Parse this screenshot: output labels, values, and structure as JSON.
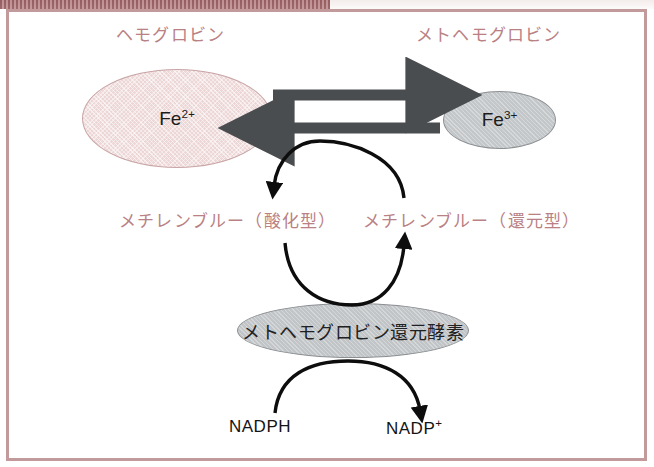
{
  "figure": {
    "top_labels": {
      "left": "ヘモグロビン",
      "right": "メトヘモグロビン"
    },
    "species": {
      "ferrous": "Fe",
      "ferrous_charge": "2+",
      "ferric": "Fe",
      "ferric_charge": "3+"
    },
    "middle_labels": {
      "left": "メチレンブルー（酸化型）",
      "right": "メチレンブルー（還元型）"
    },
    "enzyme": "メトヘモグロビン還元酵素",
    "cofactors": {
      "left": "NADPH",
      "right": "NADP",
      "right_charge": "+"
    },
    "colors": {
      "label_rose": "#b98184",
      "frame_border": "#c29a9c",
      "hemoglobin_fill": "#edd6d6",
      "methemoglobin_fill": "#c4c7c9",
      "enzyme_fill": "#c2c5c7",
      "arrow_gray": "#4a4d50",
      "curve_black": "#0d0d0d"
    },
    "arrows": {
      "top_right_arrow": "hemoglobin-to-methemoglobin",
      "bottom_left_arrow": "methemoglobin-to-hemoglobin",
      "upper_curve": "methylene-blue-reduced-to-oxidized",
      "middle_curve": "oxidized-to-reduced-via-reductase",
      "lower_curve": "NADPH-to-NADP-plus"
    }
  }
}
